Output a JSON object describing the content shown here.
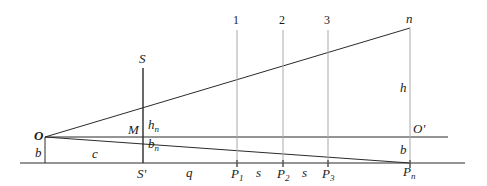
{
  "diagram": {
    "type": "geometric-construction",
    "points": {
      "O": {
        "label": "O",
        "x": 45,
        "y": 137
      },
      "O_prime": {
        "label": "O'",
        "x": 410,
        "y": 137
      },
      "S": {
        "label": "S",
        "x": 143,
        "y": 68
      },
      "S_prime": {
        "label": "S'",
        "x": 143,
        "y": 163
      },
      "M": {
        "label": "M",
        "x": 143,
        "y": 137
      },
      "n": {
        "label": "n",
        "x": 410,
        "y": 28
      },
      "P1": {
        "label": "P",
        "sub": "1",
        "x": 237,
        "y": 163
      },
      "P2": {
        "label": "P",
        "sub": "2",
        "x": 283,
        "y": 163
      },
      "P3": {
        "label": "P",
        "sub": "3",
        "x": 328,
        "y": 163
      },
      "Pn": {
        "label": "P",
        "sub": "n",
        "x": 410,
        "y": 163
      }
    },
    "vertical_markers": [
      {
        "label": "1",
        "x": 237
      },
      {
        "label": "2",
        "x": 283
      },
      {
        "label": "3",
        "x": 328
      },
      {
        "label": "n",
        "x": 410
      }
    ],
    "segment_labels": {
      "b_left": "b",
      "c": "c",
      "q": "q",
      "s1": "s",
      "s2": "s",
      "h": "h",
      "b_right": "b",
      "h_n": {
        "main": "h",
        "sub": "n"
      },
      "b_n": {
        "main": "b",
        "sub": "n"
      }
    },
    "colors": {
      "line": "#2a2a2a",
      "guide": "#a8a8a8",
      "text": "#1a1a1a"
    }
  }
}
